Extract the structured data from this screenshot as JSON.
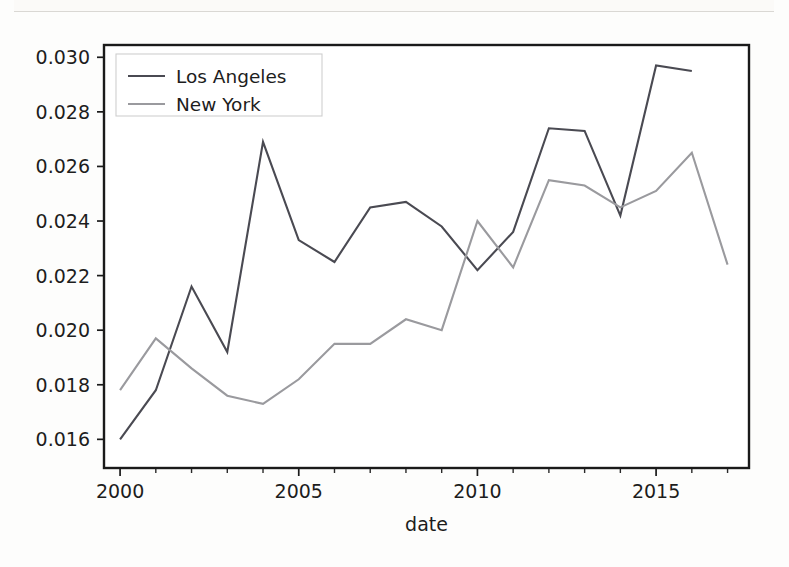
{
  "figure": {
    "background_color": "#fdfdfc",
    "plot_background_color": "#ffffff",
    "axes_color": "#1a1a1a"
  },
  "legend": {
    "entries": [
      {
        "label": "Los Angeles",
        "color": "#4a4a52"
      },
      {
        "label": "New York",
        "color": "#9a9a9e"
      }
    ]
  },
  "axes": {
    "xlabel": "date",
    "ylabel": "",
    "x_tick_labels": [
      "2000",
      "2005",
      "2010",
      "2015"
    ],
    "x_tick_values": [
      2000,
      2005,
      2010,
      2015
    ],
    "x_minor_tick_values": [
      2001,
      2002,
      2003,
      2004,
      2006,
      2007,
      2008,
      2009,
      2011,
      2012,
      2013,
      2014,
      2016,
      2017
    ],
    "y_tick_labels": [
      "0.016",
      "0.018",
      "0.020",
      "0.022",
      "0.024",
      "0.026",
      "0.028",
      "0.030"
    ],
    "y_tick_values": [
      0.016,
      0.018,
      0.02,
      0.022,
      0.024,
      0.026,
      0.028,
      0.03
    ],
    "xlim": [
      1999.55,
      2017.6
    ],
    "ylim": [
      0.01495,
      0.03045
    ]
  },
  "chart_data": {
    "type": "line",
    "title": "",
    "xlabel": "date",
    "ylabel": "",
    "xlim": [
      1999.55,
      2017.6
    ],
    "ylim": [
      0.01495,
      0.03045
    ],
    "grid": false,
    "legend_position": "upper left",
    "x": [
      2000,
      2001,
      2002,
      2003,
      2004,
      2005,
      2006,
      2007,
      2008,
      2009,
      2010,
      2011,
      2012,
      2013,
      2014,
      2015,
      2016,
      2017
    ],
    "series": [
      {
        "name": "Los Angeles",
        "color": "#4a4a52",
        "x": [
          2000,
          2001,
          2002,
          2003,
          2004,
          2005,
          2006,
          2007,
          2008,
          2009,
          2010,
          2011,
          2012,
          2013,
          2014,
          2015,
          2016
        ],
        "values": [
          0.016,
          0.0178,
          0.0216,
          0.0192,
          0.0269,
          0.0233,
          0.0225,
          0.0245,
          0.0247,
          0.0238,
          0.0222,
          0.0236,
          0.0274,
          0.0273,
          0.0242,
          0.0297,
          0.0295
        ]
      },
      {
        "name": "New York",
        "color": "#9a9a9e",
        "x": [
          2000,
          2001,
          2002,
          2003,
          2004,
          2005,
          2006,
          2007,
          2008,
          2009,
          2010,
          2011,
          2012,
          2013,
          2014,
          2015,
          2016,
          2017
        ],
        "values": [
          0.0178,
          0.0197,
          0.0186,
          0.0176,
          0.0173,
          0.0182,
          0.0195,
          0.0195,
          0.0204,
          0.02,
          0.024,
          0.0223,
          0.0255,
          0.0253,
          0.0245,
          0.0251,
          0.0265,
          0.0224
        ]
      }
    ]
  }
}
